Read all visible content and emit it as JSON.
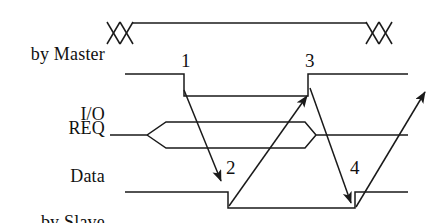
{
  "diagram": {
    "stroke_color": "#1a1a1a",
    "background_color": "#ffffff",
    "signals": [
      {
        "id": "io",
        "label_line1": "by Master",
        "label_line2": "I/O",
        "waveform": "bus-valid-with-crosshatch-ends"
      },
      {
        "id": "req",
        "label_line1": "REQ",
        "label_line2": "",
        "waveform": "high-low-high"
      },
      {
        "id": "data",
        "label_line1": "Data",
        "label_line2": "",
        "waveform": "bus-open-close"
      },
      {
        "id": "ack",
        "label_line1": "by Slave",
        "label_line2": "ACK",
        "waveform": "high-low-high"
      }
    ],
    "event_markers": [
      {
        "id": "m1",
        "text": "1"
      },
      {
        "id": "m2",
        "text": "2"
      },
      {
        "id": "m3",
        "text": "3"
      },
      {
        "id": "m4",
        "text": "4"
      }
    ],
    "causality_arrows": [
      {
        "id": "a1",
        "from": "1",
        "to": "2"
      },
      {
        "id": "a2",
        "from": "2",
        "to": "3"
      },
      {
        "id": "a3",
        "from": "3",
        "to": "4"
      },
      {
        "id": "a4",
        "from": "4",
        "to": "next-cycle"
      }
    ]
  }
}
